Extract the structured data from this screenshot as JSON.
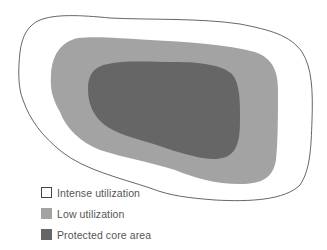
{
  "diagram": {
    "zones": [
      {
        "id": "intense",
        "label": "Intense utilization",
        "fill": "#ffffff",
        "stroke": "#555555"
      },
      {
        "id": "low",
        "label": "Low utilization",
        "fill": "#a3a3a3",
        "stroke": "none"
      },
      {
        "id": "core",
        "label": "Protected core area",
        "fill": "#666666",
        "stroke": "none"
      }
    ]
  },
  "legend": {
    "items": [
      {
        "label": "Intense utilization",
        "fill": "#ffffff",
        "border": "#444444"
      },
      {
        "label": "Low utilization",
        "fill": "#a3a3a3",
        "border": "#a3a3a3"
      },
      {
        "label": "Protected core area",
        "fill": "#666666",
        "border": "#666666"
      }
    ]
  }
}
